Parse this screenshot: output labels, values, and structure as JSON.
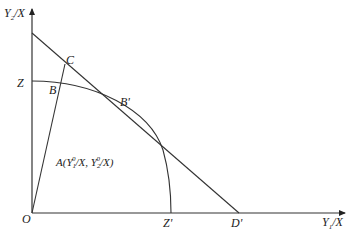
{
  "diagram": {
    "type": "production-possibility-frontier",
    "axes": {
      "y_label": "Y",
      "y_label_sub": "2",
      "y_label_suffix": "/X",
      "x_label": "Y",
      "x_label_sub": "1",
      "x_label_suffix": "/X",
      "origin_label": "O"
    },
    "points": {
      "Z": "Z",
      "Z_prime": "Z'",
      "B": "B",
      "B_prime": "B'",
      "C": "C",
      "D_prime": "D'"
    },
    "annotation": {
      "prefix": "A(Y",
      "sub1": "1",
      "sup1": "0",
      "mid": "/X,  Y",
      "sub2": "2",
      "sup2": "0",
      "suffix": "/X)"
    },
    "colors": {
      "line": "#333333",
      "text": "#222222",
      "background": "#ffffff"
    }
  }
}
